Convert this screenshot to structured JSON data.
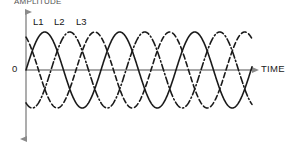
{
  "figure": {
    "amplitude_axis_label": "AMPLITUDE",
    "time_axis_label": "TIME",
    "origin_label": "0"
  },
  "legend": {
    "items": [
      {
        "label": "L1",
        "style": "solid"
      },
      {
        "label": "L2",
        "style": "dash-dot"
      },
      {
        "label": "L3",
        "style": "dashed"
      }
    ]
  },
  "colors": {
    "wave": "#1a1a1a",
    "axis": "#8a8a8a",
    "background": "#ffffff",
    "text": "#1b1b1b"
  },
  "chart_data": {
    "type": "line",
    "title": "",
    "xlabel": "TIME",
    "ylabel": "AMPLITUDE",
    "grid": false,
    "legend_position": "top-left",
    "xlim": [
      0,
      3.02
    ],
    "ylim": [
      -1.15,
      1.15
    ],
    "x_tick_labels": [],
    "y_tick_labels": [
      "0"
    ],
    "waveform": {
      "form": "sine",
      "amplitude": 1.0,
      "cycles_shown": 3.02,
      "phase_offsets_deg": [
        0,
        -120,
        -240
      ]
    },
    "series": [
      {
        "name": "L1",
        "style": "solid",
        "color": "#1a1a1a",
        "phase_deg": 0,
        "amplitude": 1.0,
        "description": "Phase 1 sine wave, reference phase"
      },
      {
        "name": "L2",
        "style": "dash-dot",
        "color": "#1a1a1a",
        "phase_deg": -120,
        "amplitude": 1.0,
        "description": "Phase 2 sine wave, lagging L1 by 120 degrees"
      },
      {
        "name": "L3",
        "style": "dashed",
        "color": "#1a1a1a",
        "phase_deg": -240,
        "amplitude": 1.0,
        "description": "Phase 3 sine wave, lagging L1 by 240 degrees"
      }
    ]
  },
  "geometry": {
    "axis_x_px": 26,
    "axis_y_px": 70,
    "x_start_px": 26,
    "x_end_px": 252,
    "y_top_px": 9,
    "y_bottom_px": 141,
    "amplitude_px": 38,
    "period_px": 75
  }
}
